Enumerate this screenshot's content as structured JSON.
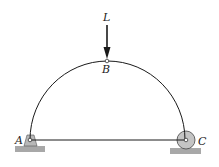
{
  "diagram": {
    "labels": {
      "load": "L",
      "apex": "B",
      "left_support": "A",
      "right_support": "C"
    },
    "colors": {
      "line": "#1a1a1a",
      "support_fill": "#b8b8b8",
      "ground_fill": "#9a9a9a",
      "roller_fill": "#c4c4c4"
    }
  }
}
